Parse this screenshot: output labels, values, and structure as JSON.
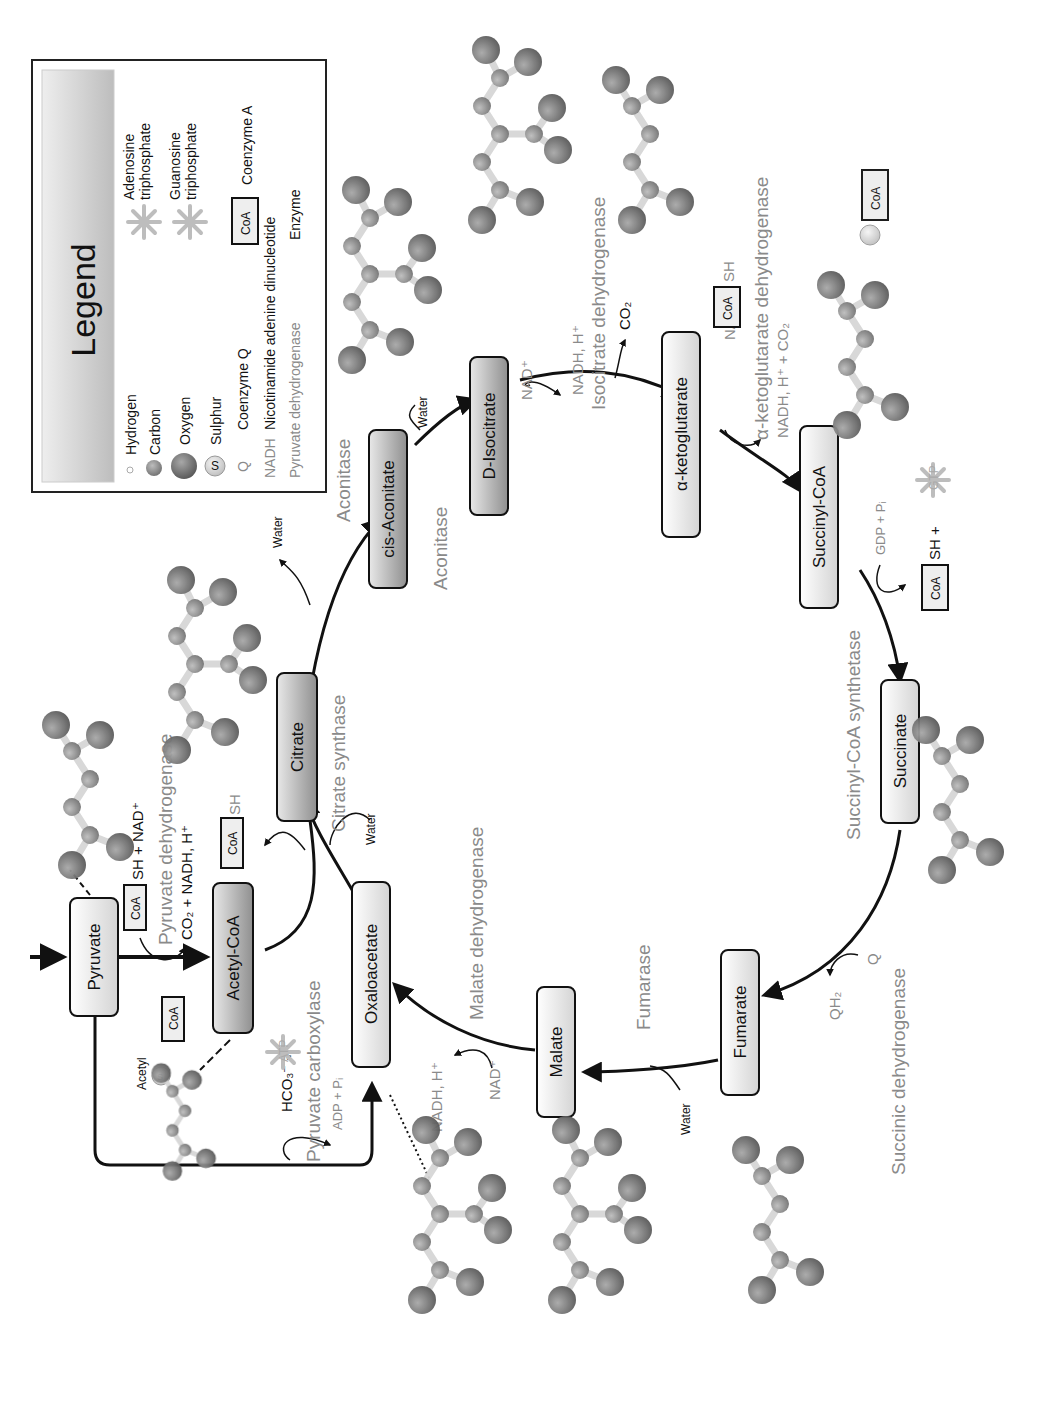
{
  "legend": {
    "title": "Legend",
    "items": [
      {
        "symbol": "hydrogen-atom",
        "label": "Hydrogen"
      },
      {
        "symbol": "carbon-atom",
        "label": "Carbon"
      },
      {
        "symbol": "oxygen-atom",
        "label": "Oxygen"
      },
      {
        "symbol": "sulphur-atom",
        "symbol_text": "S",
        "label": "Sulphur"
      },
      {
        "symbol": "Q",
        "label": "Coenzyme Q"
      },
      {
        "symbol": "NADH",
        "label": "Nicotinamide adenine dinucleotide"
      },
      {
        "symbol": "Pyruvate dehydrogenase",
        "label": "Enzyme"
      },
      {
        "symbol": "ATP",
        "label": "Adenosine triphosphate",
        "label_lines": [
          "Adenosine",
          "triphosphate"
        ]
      },
      {
        "symbol": "GTP",
        "label": "Guanosine triphosphate",
        "label_lines": [
          "Guanosine",
          "triphosphate"
        ]
      },
      {
        "symbol": "CoA",
        "label": "Coenzyme A"
      }
    ]
  },
  "nodes": {
    "pyruvate": "Pyruvate",
    "acetyl_coa": "Acetyl-CoA",
    "citrate": "Citrate",
    "cis_aconitate": "cis-Aconitate",
    "d_isocitrate": "D-Isocitrate",
    "a_ketoglutarate": "α-ketoglutarate",
    "succinyl_coa": "Succinyl-CoA",
    "succinate": "Succinate",
    "fumarate": "Fumarate",
    "malate": "Malate",
    "oxaloacetate": "Oxaloacetate"
  },
  "enzymes": {
    "pyruvate_dehydrogenase": "Pyruvate dehydrogenase",
    "pyruvate_carboxylase": "Pyruvate carboxylase",
    "citrate_synthase": "Citrate synthase",
    "aconitase_1": "Aconitase",
    "aconitase_2": "Aconitase",
    "isocitrate_dehydrogenase": "Isocitrate dehydrogenase",
    "a_ketoglutarate_dehydrogenase": "α-ketoglutarate dehydrogenase",
    "succinyl_coa_synthetase": "Succinyl-CoA synthetase",
    "succinic_dehydrogenase": "Succinic dehydrogenase",
    "fumarase": "Fumarase",
    "malate_dehydrogenase": "Malate dehydrogenase"
  },
  "cofactors": {
    "pdh_in": "SH + NAD⁺",
    "pdh_out": "CO₂ + NADH, H⁺",
    "coa": "CoA",
    "sh": "SH",
    "acetyl": "Acetyl",
    "pc_in": "HCO₃⁻ +",
    "pc_out": "ADP + Pᵢ",
    "atp": "ATP",
    "gtp": "GTP",
    "water": "Water",
    "nad": "NAD⁺",
    "nadh_h": "NADH, H⁺",
    "co2": "CO₂",
    "akg_in": "NAD⁺ +",
    "akg_out": "NADH, H⁺ + CO₂",
    "gdp_pi": "GDP + Pᵢ",
    "sh_plus": "SH +",
    "q": "Q",
    "qh2": "QH₂",
    "s": "S"
  },
  "colors": {
    "node_fill_light": "#f2f2f2",
    "node_fill_dark": "#9a9a9a",
    "enzyme_text": "#8a8a8a",
    "oxygen": "#6e6e6e",
    "carbon": "#8c8c8c",
    "hydrogen": "#e6e6e6",
    "sulphur": "#d9d9d9"
  }
}
